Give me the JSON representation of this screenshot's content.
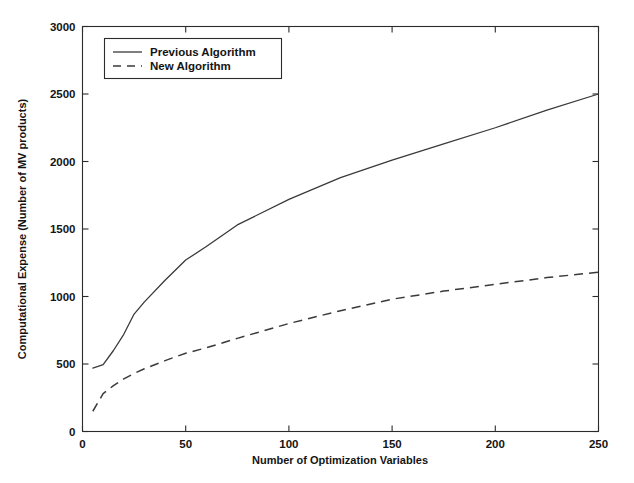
{
  "chart_data": {
    "type": "line",
    "title": "",
    "xlabel": "Number of Optimization Variables",
    "ylabel": "Computational Expense (Number of MV products)",
    "xlim": [
      0,
      250
    ],
    "ylim": [
      0,
      3000
    ],
    "xticks": [
      0,
      50,
      100,
      150,
      200,
      250
    ],
    "yticks": [
      0,
      500,
      1000,
      1500,
      2000,
      2500,
      3000
    ],
    "xtick_labels": [
      "0",
      "50",
      "100",
      "150",
      "200",
      "250"
    ],
    "ytick_labels": [
      "0",
      "500",
      "1000",
      "1500",
      "2000",
      "2500",
      "3000"
    ],
    "grid": false,
    "legend_position": "upper left inside",
    "series": [
      {
        "name": "Previous Algorithm",
        "style": "solid",
        "color": "#3a3a3a",
        "x": [
          5,
          10,
          15,
          20,
          25,
          30,
          40,
          50,
          60,
          75,
          100,
          125,
          150,
          175,
          200,
          225,
          250
        ],
        "values": [
          470,
          495,
          600,
          720,
          870,
          960,
          1120,
          1270,
          1370,
          1530,
          1720,
          1880,
          2010,
          2130,
          2250,
          2380,
          2500
        ]
      },
      {
        "name": "New Algorithm",
        "style": "dashed",
        "color": "#3a3a3a",
        "x": [
          5,
          10,
          15,
          20,
          25,
          30,
          40,
          50,
          60,
          75,
          100,
          125,
          150,
          175,
          200,
          225,
          250
        ],
        "values": [
          150,
          280,
          340,
          390,
          430,
          465,
          525,
          580,
          620,
          690,
          800,
          895,
          980,
          1040,
          1090,
          1140,
          1180
        ]
      }
    ],
    "legend": [
      {
        "label": "Previous Algorithm",
        "style": "solid"
      },
      {
        "label": "New Algorithm",
        "style": "dashed"
      }
    ]
  },
  "figure": {
    "background": "#ffffff",
    "axis_color": "#2b2b2b",
    "text_color": "#141414"
  }
}
